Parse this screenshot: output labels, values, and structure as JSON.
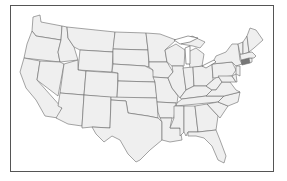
{
  "map": {
    "type": "us-states-outline",
    "region": "Contiguous United States",
    "highlighted_state": "Connecticut",
    "colors": {
      "state_fill": "#efefef",
      "state_stroke": "#6a6a6a",
      "highlight_fill": "#777777",
      "frame_border": "#555555",
      "background": "#ffffff"
    }
  }
}
